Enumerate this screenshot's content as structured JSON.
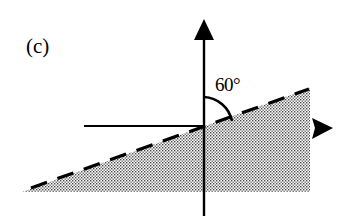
{
  "figure": {
    "panel_label": "(c)",
    "angle_label": "60°",
    "angle_degrees": 60,
    "colors": {
      "line": "#000000",
      "shading_dot": "#555555",
      "background": "#ffffff"
    },
    "elements": {
      "vertical_axis": {
        "direction": "up",
        "arrowhead": true
      },
      "horizontal_axis": {
        "direction": "right",
        "arrowhead": true
      },
      "reference_line": {
        "direction": "left",
        "style": "solid"
      },
      "inclined_boundary": {
        "style": "dashed",
        "angle_from_vertical": 60
      },
      "shaded_region": {
        "pattern": "stippled",
        "position": "below inclined boundary"
      }
    }
  }
}
